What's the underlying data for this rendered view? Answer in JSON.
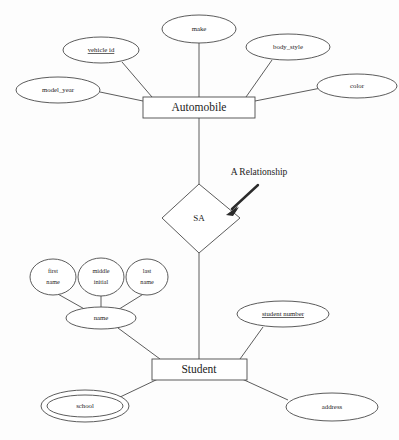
{
  "diagram": {
    "type": "entity-relationship-diagram",
    "annotation": {
      "label": "A Relationship",
      "points_to": "SA"
    },
    "entities": [
      {
        "id": "automobile",
        "label": "Automobile"
      },
      {
        "id": "student",
        "label": "Student"
      }
    ],
    "relationships": [
      {
        "id": "sa",
        "label": "SA",
        "connects": [
          "Automobile",
          "Student"
        ]
      }
    ],
    "attributes": {
      "automobile": [
        {
          "id": "model_year",
          "label": "model_year",
          "kind": "simple"
        },
        {
          "id": "vehicle_id",
          "label": "vehicle id",
          "kind": "key"
        },
        {
          "id": "make",
          "label": "make",
          "kind": "simple"
        },
        {
          "id": "body_style",
          "label": "body_style",
          "kind": "simple"
        },
        {
          "id": "color",
          "label": "color",
          "kind": "simple"
        }
      ],
      "student": [
        {
          "id": "name",
          "label": "name",
          "kind": "composite"
        },
        {
          "id": "student_number",
          "label": "student number",
          "kind": "key"
        },
        {
          "id": "school",
          "label": "school",
          "kind": "multivalued"
        },
        {
          "id": "address",
          "label": "address",
          "kind": "simple"
        }
      ]
    },
    "sub_attributes": {
      "name": [
        {
          "id": "first_name",
          "line1": "first",
          "line2": "name"
        },
        {
          "id": "middle_initial",
          "line1": "middle",
          "line2": "initial"
        },
        {
          "id": "last_name",
          "line1": "last",
          "line2": "name"
        }
      ]
    },
    "colors": {
      "background": "#fdfdfd",
      "stroke": "#4a4a4a",
      "text": "#1c1c1c",
      "arrow": "#2b2b2b"
    }
  }
}
